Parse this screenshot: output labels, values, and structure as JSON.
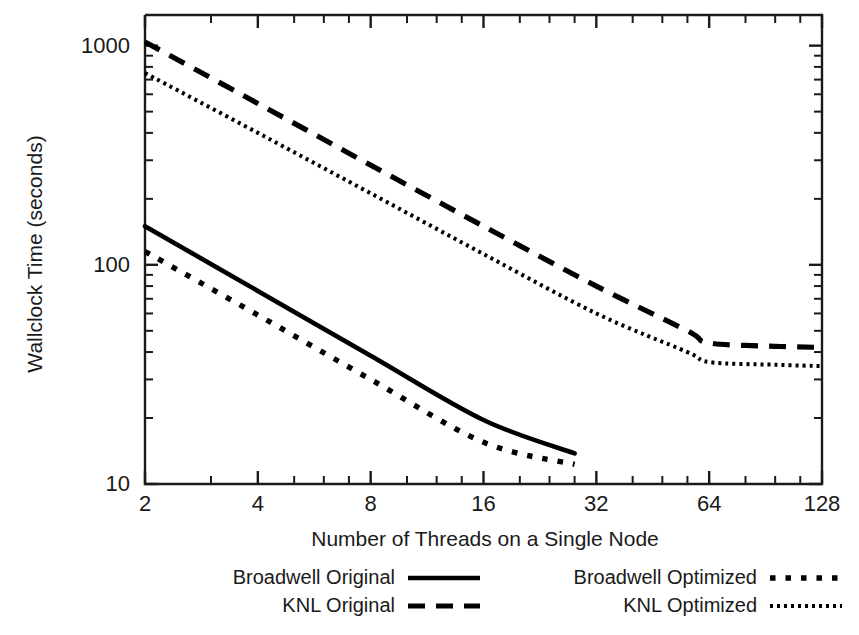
{
  "chart_data": {
    "type": "line",
    "title": "",
    "xlabel": "Number of Threads on a Single Node",
    "ylabel": "Wallclock Time (seconds)",
    "xscale": "log2",
    "yscale": "log10",
    "xlim": [
      2,
      128
    ],
    "ylim": [
      10,
      1380
    ],
    "xticks": [
      2,
      4,
      8,
      16,
      32,
      64,
      128
    ],
    "xticklabels": [
      "2",
      "4",
      "8",
      "16",
      "32",
      "64",
      "128"
    ],
    "yticks": [
      10,
      100,
      1000
    ],
    "yticklabels": [
      "10",
      "100",
      "1000"
    ],
    "grid": false,
    "legend_position": "below-axes",
    "series": [
      {
        "name": "Broadwell Original",
        "style": "solid",
        "color": "#000000",
        "x": [
          2,
          4,
          8,
          16,
          28
        ],
        "y": [
          150,
          76,
          38.5,
          19.6,
          13.8
        ]
      },
      {
        "name": "KNL Original",
        "style": "dashed",
        "color": "#000000",
        "x": [
          2,
          4,
          8,
          16,
          32,
          56,
          64,
          96,
          128
        ],
        "y": [
          1040,
          545,
          285,
          150,
          80,
          50,
          44,
          42.5,
          42
        ]
      },
      {
        "name": "Broadwell Optimized",
        "style": "dotted",
        "color": "#000000",
        "x": [
          2,
          4,
          8,
          16,
          28
        ],
        "y": [
          115,
          59,
          30,
          15.5,
          12.3
        ]
      },
      {
        "name": "KNL Optimized",
        "style": "fine-dotted",
        "color": "#000000",
        "x": [
          2,
          4,
          8,
          16,
          32,
          56,
          64,
          96,
          128
        ],
        "y": [
          750,
          400,
          212,
          112,
          60,
          40,
          36,
          35,
          34.5
        ]
      }
    ]
  },
  "axes": {
    "ylabel": "Wallclock Time (seconds)",
    "xlabel": "Number of Threads on a Single Node",
    "ytick_labels": [
      "1000",
      "100",
      "10"
    ],
    "xtick_labels": [
      "2",
      "4",
      "8",
      "16",
      "32",
      "64",
      "128"
    ]
  },
  "legend": {
    "entries": [
      {
        "label": "Broadwell Original",
        "style": "solid"
      },
      {
        "label": "KNL Original",
        "style": "dashed"
      },
      {
        "label": "Broadwell Optimized",
        "style": "dotted"
      },
      {
        "label": "KNL Optimized",
        "style": "fine-dotted"
      }
    ]
  },
  "colors": {
    "ink": "#1a1a1a",
    "line": "#000000",
    "background": "#ffffff"
  }
}
